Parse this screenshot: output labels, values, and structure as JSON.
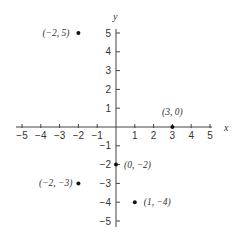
{
  "chart_data": {
    "type": "scatter",
    "title": "",
    "xlabel": "x",
    "ylabel": "y",
    "xlim": [
      -5,
      5
    ],
    "ylim": [
      -5,
      5
    ],
    "grid": false,
    "legend": null,
    "x_ticks": [
      -5,
      -4,
      -3,
      -2,
      -1,
      1,
      2,
      3,
      4,
      5
    ],
    "y_ticks": [
      -5,
      -4,
      -3,
      -2,
      -1,
      1,
      2,
      3,
      4,
      5
    ],
    "x_tick_labels": [
      "−5",
      "−4",
      "−3",
      "−2",
      "−1",
      "1",
      "2",
      "3",
      "4",
      "5"
    ],
    "y_tick_labels": [
      "−5",
      "−4",
      "−3",
      "−2",
      "−1",
      "1",
      "2",
      "3",
      "4",
      "5"
    ],
    "points": [
      {
        "x": -2,
        "y": 5,
        "label": "(−2, 5)"
      },
      {
        "x": 3,
        "y": 0,
        "label": "(3, 0)"
      },
      {
        "x": 0,
        "y": -2,
        "label": "(0, −2)"
      },
      {
        "x": -2,
        "y": -3,
        "label": "(−2, −3)"
      },
      {
        "x": 1,
        "y": -4,
        "label": "(1, −4)"
      }
    ]
  },
  "colors": {
    "axis": "#444444",
    "point": "#111111",
    "text": "#333333"
  }
}
